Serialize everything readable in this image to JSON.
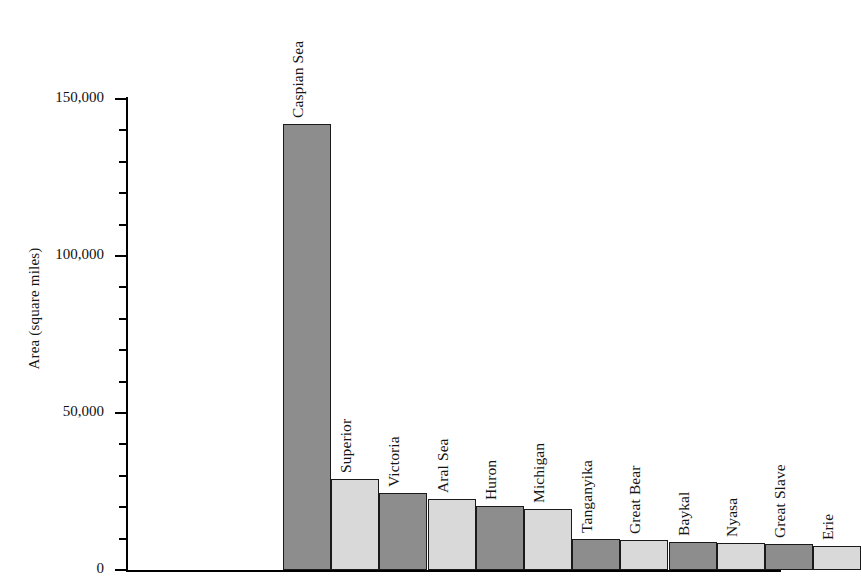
{
  "chart_data": {
    "type": "bar",
    "title": "",
    "xlabel": "",
    "ylabel": "Area (square miles)",
    "ylim": [
      0,
      155000
    ],
    "grid": false,
    "legend": null,
    "y_major_ticks": [
      0,
      50000,
      100000,
      150000
    ],
    "y_major_tick_labels": [
      "0",
      "50,000",
      "100,000",
      "150,000"
    ],
    "y_minor_tick_interval": 10000,
    "categories": [
      "Caspian Sea",
      "Superior",
      "Victoria",
      "Aral Sea",
      "Huron",
      "Michigan",
      "Tanganyika",
      "Great Bear",
      "Baykal",
      "Nyasa",
      "Great Slave",
      "Erie"
    ],
    "values": [
      142000,
      29000,
      24500,
      22500,
      20500,
      19500,
      10000,
      9700,
      9000,
      8700,
      8200,
      7800
    ],
    "bar_fill_pattern": [
      "dark",
      "light",
      "dark",
      "light",
      "dark",
      "light",
      "dark",
      "light",
      "dark",
      "light",
      "dark",
      "light"
    ],
    "colors": {
      "bar_dark": "#8d8d8d",
      "bar_light": "#d9d9d9",
      "outline": "#1a1a1a",
      "axis": "#000000",
      "background": "#ffffff",
      "text": "#141414"
    },
    "label_orientation": "vertical-rotated-90"
  }
}
